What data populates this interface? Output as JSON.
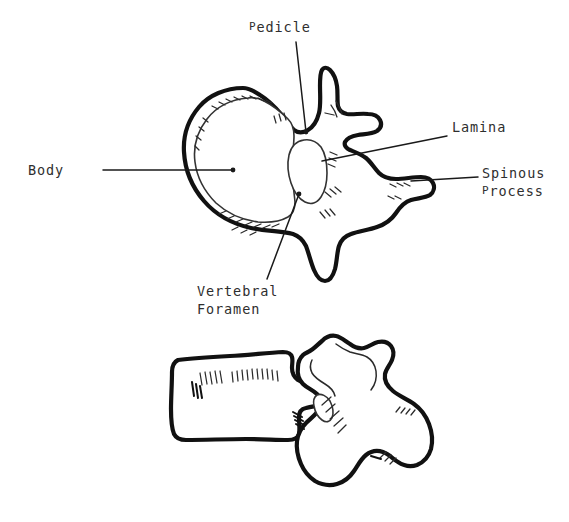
{
  "figure": {
    "background_color": "#ffffff",
    "ink_color": "#111111",
    "views": [
      {
        "name": "superior-view",
        "description": "Superior (axial) view of a lumbar vertebra showing body, pedicle, vertebral foramen, lamina and spinous process"
      },
      {
        "name": "lateral-view",
        "description": "Lateral (side) view of the same vertebra showing the rectangular body and posterior processes"
      }
    ]
  },
  "labels": {
    "body": {
      "text": "Body",
      "leader": "horizontal line from label to center of vertebral body"
    },
    "pedicle": {
      "text": "Pedicle",
      "lead_cap": "P",
      "lead_rest": "edicle",
      "leader": "near-vertical line down to pedicle region"
    },
    "lamina": {
      "text": "Lamina",
      "leader": "diagonal line down-left to lamina"
    },
    "spinous_process": {
      "line1": "Spinous",
      "line2_cap": "P",
      "line2_rest": "rocess",
      "leader": "horizontal line left to tip of spinous process"
    },
    "vertebral_foramen": {
      "line1": "Vertebral",
      "line2": "Foramen",
      "leader": "diagonal line up-right into the vertebral foramen"
    }
  }
}
